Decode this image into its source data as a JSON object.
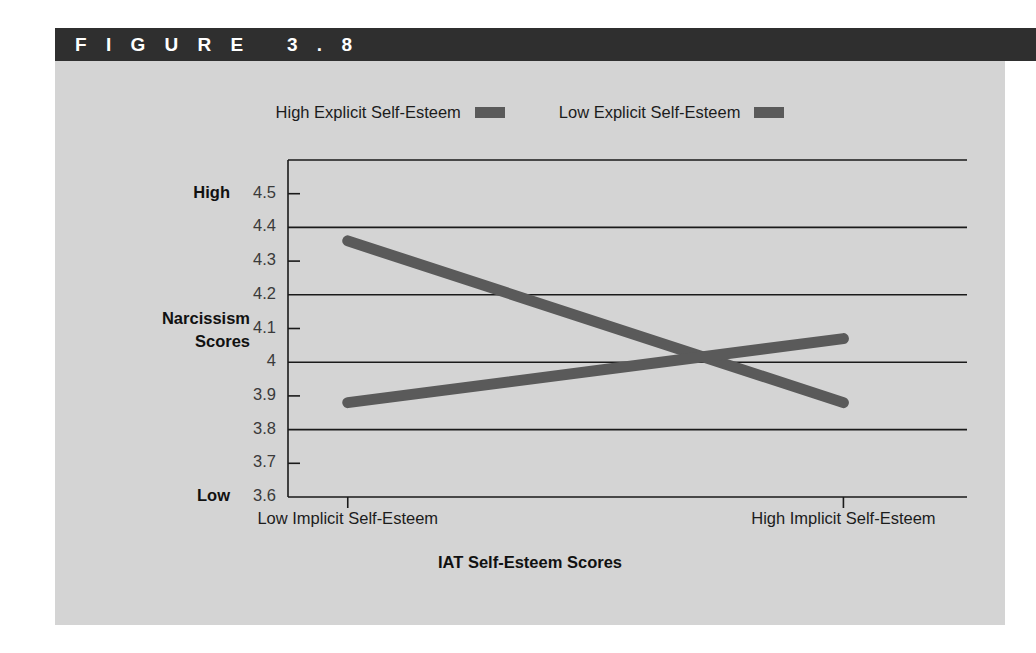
{
  "figure": {
    "header_label": "F I G U R E   3 . 8",
    "panel_bg": "#d4d4d4",
    "header_bg": "#2f2f2f"
  },
  "legend": {
    "position": "top-center",
    "entries": [
      {
        "label": "High Explicit Self-Esteem",
        "color": "#5a5a5a",
        "swatch": "legend-swatch-high"
      },
      {
        "label": "Low Explicit Self-Esteem",
        "color": "#5a5a5a",
        "swatch": "legend-swatch-low"
      }
    ]
  },
  "axes": {
    "y_title_line1": "Narcissism",
    "y_title_line2": "Scores",
    "y_high_label": "High",
    "y_low_label": "Low",
    "x_title": "IAT Self-Esteem Scores"
  },
  "chart_data": {
    "type": "line",
    "title": "",
    "xlabel": "IAT Self-Esteem Scores",
    "ylabel": "Narcissism Scores",
    "categories": [
      "Low Implicit Self-Esteem",
      "High Implicit Self-Esteem"
    ],
    "ylim": [
      3.6,
      4.6
    ],
    "ytick_labels": [
      "4.5",
      "4.4",
      "4.3",
      "4.2",
      "4.1",
      "4",
      "3.9",
      "3.8",
      "3.7",
      "3.6"
    ],
    "ytick_values": [
      4.5,
      4.4,
      4.3,
      4.2,
      4.1,
      4.0,
      3.9,
      3.8,
      3.7,
      3.6
    ],
    "gridline_values": [
      4.6,
      4.4,
      4.2,
      4.0,
      3.8,
      3.6
    ],
    "grid": true,
    "legend_position": "top-center",
    "series": [
      {
        "name": "High Explicit Self-Esteem",
        "color": "#5a5a5a",
        "values": [
          4.36,
          3.88
        ]
      },
      {
        "name": "Low Explicit Self-Esteem",
        "color": "#5a5a5a",
        "values": [
          3.88,
          4.07
        ]
      }
    ]
  }
}
